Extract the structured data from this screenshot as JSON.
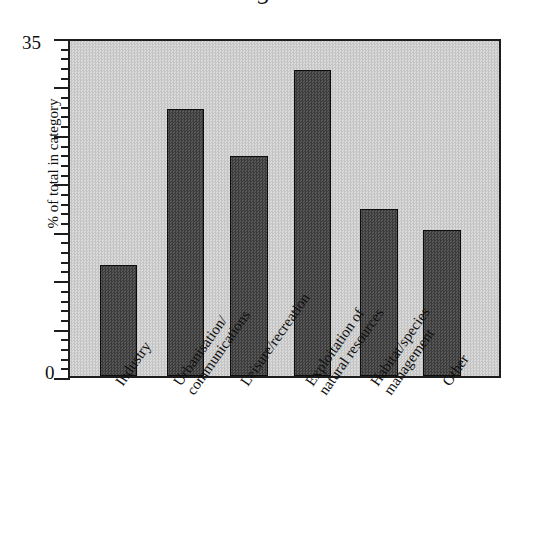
{
  "figure": {
    "top_cut_text": "g",
    "background_color": "#ffffff",
    "plot_fill_color": "#cfcfcf",
    "bar_color": "#4a4a4a",
    "axis_color": "#1d1d1d"
  },
  "axes": {
    "y_title": "% of total in category",
    "y_tick_labels": {
      "max": "35",
      "min": "0"
    },
    "y_min": 0,
    "y_max": 35,
    "y_major_interval": 5,
    "y_minor_interval": 1
  },
  "chart_data": {
    "type": "bar",
    "title": "",
    "xlabel": "",
    "ylabel": "% of total in category",
    "ylim": [
      0,
      35
    ],
    "grid": false,
    "legend": "none",
    "categories": [
      "Industry",
      "Urbanisation/\ncommunications",
      "Leisure/recreation",
      "Exploitation of\nnatural resources",
      "Habitat/species\nmanagement",
      "Other"
    ],
    "values": [
      11.6,
      27.9,
      23.0,
      32.0,
      17.5,
      15.3
    ],
    "bar_geometry": [
      {
        "left_pct": 6.9,
        "width_pct": 8.7
      },
      {
        "left_pct": 22.6,
        "width_pct": 8.7
      },
      {
        "left_pct": 37.4,
        "width_pct": 8.7
      },
      {
        "left_pct": 52.2,
        "width_pct": 8.7
      },
      {
        "left_pct": 67.7,
        "width_pct": 8.7
      },
      {
        "left_pct": 82.4,
        "width_pct": 8.7
      }
    ],
    "label_offsets_px": [
      45,
      103,
      170,
      235,
      300,
      372
    ]
  }
}
